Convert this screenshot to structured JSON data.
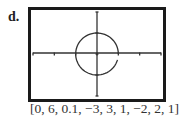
{
  "figure": {
    "label": "d.",
    "caption": "[0, 6, 0.1, −3, 3, 1, −2, 2, 1]"
  },
  "window": {
    "tmin": 0,
    "tmax": 6,
    "tstep": 0.1,
    "xmin": -3,
    "xmax": 3,
    "xscl": 1,
    "ymin": -2,
    "ymax": 2,
    "yscl": 1
  },
  "graph": {
    "type": "parametric",
    "shape": "circle",
    "center": [
      0,
      0
    ],
    "radius": 1
  },
  "colors": {
    "frame": "#1a1a1a",
    "axes": "#333333",
    "curve": "#333333"
  }
}
